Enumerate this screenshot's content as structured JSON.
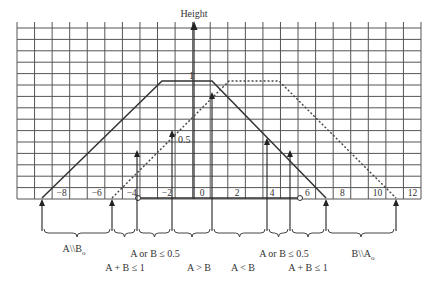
{
  "figure": {
    "axis_title": "Height",
    "height_labels": {
      "one": "1",
      "half": "0.5"
    },
    "x_tick_labels": [
      "−8",
      "−6",
      "−4",
      "−2",
      "0",
      "2",
      "4",
      "6",
      "8",
      "10",
      "12"
    ],
    "x_tick_values": [
      -8,
      -6,
      -4,
      -2,
      0,
      2,
      4,
      6,
      8,
      10,
      12
    ],
    "regions": [
      {
        "id": "a-minus-b",
        "label": "A\\\\B",
        "subscript": "o"
      },
      {
        "id": "sum-left",
        "label": "A + B ≤ 1"
      },
      {
        "id": "half-left",
        "label": "A or B ≤ 0.5"
      },
      {
        "id": "a-gt-b",
        "label": "A > B"
      },
      {
        "id": "a-lt-b",
        "label": "A < B"
      },
      {
        "id": "half-right",
        "label": "A or B ≤ 0.5"
      },
      {
        "id": "sum-right",
        "label": "A + B ≤ 1"
      },
      {
        "id": "b-minus-a",
        "label": "B\\\\A",
        "subscript": "o"
      }
    ],
    "colors": {
      "grid": "#555555",
      "solid": "#333333",
      "dashed": "#444444",
      "text": "#333333"
    }
  },
  "chart_data": {
    "type": "line",
    "title": "",
    "xlabel": "",
    "ylabel": "Height",
    "xlim": [
      -9,
      14
    ],
    "ylim": [
      0,
      1.5
    ],
    "grid": true,
    "x_ticks": [
      -8,
      -6,
      -4,
      -2,
      0,
      2,
      4,
      6,
      8,
      10,
      12
    ],
    "series": [
      {
        "name": "A (solid trapezoid)",
        "style": "solid",
        "points": [
          [
            -9,
            0
          ],
          [
            -2.1,
            1
          ],
          [
            0.7,
            1
          ],
          [
            7.2,
            0
          ]
        ]
      },
      {
        "name": "B (dashed trapezoid)",
        "style": "dashed",
        "points": [
          [
            -5,
            0
          ],
          [
            1.7,
            1
          ],
          [
            4.7,
            1
          ],
          [
            11.3,
            0
          ]
        ]
      }
    ],
    "annotations": [
      {
        "x": -9,
        "text": "A\\\\B_o region start"
      },
      {
        "x": -5,
        "text": "A + B ≤ 1 (left)"
      },
      {
        "x": -4,
        "text": "A or B ≤ 0.5 (left), height 0.5 marker"
      },
      {
        "x": -1.5,
        "text": "A > B crossover at 0.5"
      },
      {
        "x": 1,
        "text": "crossover at height ~0.9"
      },
      {
        "x": 3.9,
        "text": "A or B ≤ 0.5 (right)"
      },
      {
        "x": 5.8,
        "text": "A + B ≤ 1 (right)"
      },
      {
        "x": 7.2,
        "text": "end of A"
      },
      {
        "x": 11.3,
        "text": "end of B"
      }
    ],
    "region_labels": [
      "A\\\\B_o",
      "A + B ≤ 1",
      "A or B ≤ 0.5",
      "A > B",
      "A < B",
      "A or B ≤ 0.5",
      "A + B ≤ 1",
      "B\\\\A_o"
    ]
  }
}
